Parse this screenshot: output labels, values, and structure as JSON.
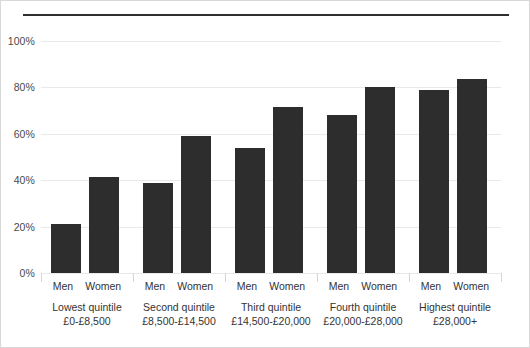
{
  "chart_data": {
    "type": "bar",
    "title": "",
    "subtitle": "",
    "xlabel": "",
    "ylabel": "",
    "ylim": [
      0,
      100
    ],
    "yticks": [
      "0%",
      "20%",
      "40%",
      "60%",
      "80%",
      "100%"
    ],
    "ytick_values": [
      0,
      20,
      40,
      60,
      80,
      100
    ],
    "grid": true,
    "legend": "none",
    "bar_color": "#2d2d2d",
    "gridline_color": "#e9e9e9",
    "categories": [
      "Lowest quintile",
      "Second quintile",
      "Third quintile",
      "Fourth quintile",
      "Highest quintile"
    ],
    "category_ranges": [
      "£0-£8,500",
      "£8,500-£14,500",
      "£14,500-£20,000",
      "£20,000-£28,000",
      "£28,000+"
    ],
    "series": [
      {
        "name": "Men",
        "values": [
          21,
          39,
          54,
          68,
          79
        ]
      },
      {
        "name": "Women",
        "values": [
          41.5,
          59,
          71.5,
          80,
          83.5
        ]
      }
    ]
  }
}
